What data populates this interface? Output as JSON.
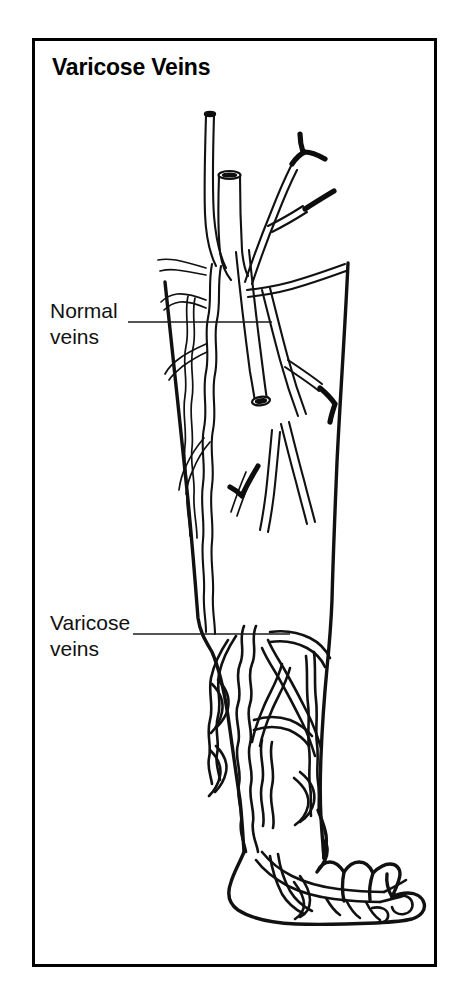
{
  "figure": {
    "title": "Varicose Veins",
    "kind": "medical-illustration",
    "background_color": "#ffffff",
    "ink_color": "#111111",
    "frame": {
      "stroke_color": "#000000",
      "stroke_width": 3,
      "x": 32,
      "y": 38,
      "width": 405,
      "height": 929
    }
  },
  "labels": [
    {
      "id": "normal-veins",
      "line1": "Normal",
      "line2": "veins",
      "text_x": 50,
      "text_y": 318,
      "leader": {
        "x1": 128,
        "y1": 322,
        "x2": 272,
        "y2": 322
      }
    },
    {
      "id": "varicose-veins",
      "line1": "Varicose",
      "line2": "veins",
      "text_x": 50,
      "text_y": 630,
      "leader": {
        "x1": 133,
        "y1": 634,
        "x2": 290,
        "y2": 634
      }
    }
  ],
  "anatomy": {
    "regions": [
      "thigh",
      "knee",
      "calf",
      "ankle",
      "foot",
      "toes"
    ],
    "vein_types": [
      {
        "name": "normal veins",
        "description": "slender straight tributaries in the thigh, some shown cut with open lumen"
      },
      {
        "name": "varicose veins",
        "description": "wide tortuous bulging veins in the calf, ankle and foot"
      }
    ]
  }
}
